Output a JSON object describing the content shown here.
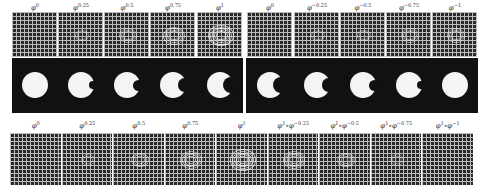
{
  "figure": {
    "top_left_labels": [
      "φ^0",
      "φ^0.25",
      "φ^0.5",
      "φ^0.75",
      "φ^1"
    ],
    "top_right_labels": [
      "φ^0",
      "φ^−0.25",
      "φ^−0.5",
      "φ^−0.75",
      "φ^−1"
    ],
    "bottom_labels": [
      "φ^0",
      "φ^0.25",
      "φ^0.5",
      "φ^0.75",
      "φ^1",
      "φ^1∘φ^−0.25",
      "φ^1∘φ^−0.5",
      "φ^1∘φ^−0.75",
      "φ^1∘φ^−1"
    ],
    "top_left": [
      {
        "base": "φ",
        "exp": "0",
        "bite": 0
      },
      {
        "base": "φ",
        "exp": "0.25",
        "bite": 0.25
      },
      {
        "base": "φ",
        "exp": "0.5",
        "bite": 0.5
      },
      {
        "base": "φ",
        "exp": "0.75",
        "bite": 0.75
      },
      {
        "base": "φ",
        "exp": "1",
        "bite": 1
      }
    ],
    "top_right": [
      {
        "base": "φ",
        "exp": "0",
        "bite": 1
      },
      {
        "base": "φ",
        "exp": "−0.25",
        "bite": 0.75
      },
      {
        "base": "φ",
        "exp": "−0.5",
        "bite": 0.5
      },
      {
        "base": "φ",
        "exp": "−0.75",
        "bite": 0.25
      },
      {
        "base": "φ",
        "exp": "−1",
        "bite": 0
      }
    ],
    "bottom": [
      {
        "base": "φ",
        "exp": "0",
        "warp": 0
      },
      {
        "base": "φ",
        "exp": "0.25",
        "warp": 0.25
      },
      {
        "base": "φ",
        "exp": "0.5",
        "warp": 0.5
      },
      {
        "base": "φ",
        "exp": "0.75",
        "warp": 0.75
      },
      {
        "base": "φ",
        "exp": "1",
        "warp": 1
      },
      {
        "base": "φ",
        "exp": "1",
        "base2": "∘φ",
        "exp2": "−0.25",
        "warp": 0.75
      },
      {
        "base": "φ",
        "exp": "1",
        "base2": "∘φ",
        "exp2": "−0.5",
        "warp": 0.5
      },
      {
        "base": "φ",
        "exp": "1",
        "base2": "∘φ",
        "exp2": "−0.75",
        "warp": 0.25
      },
      {
        "base": "φ",
        "exp": "1",
        "base2": "∘φ",
        "exp2": "−1",
        "warp": 0
      }
    ]
  }
}
